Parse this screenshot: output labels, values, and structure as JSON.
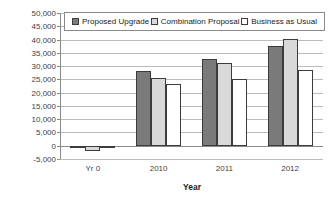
{
  "chart_data": {
    "type": "bar",
    "title": "",
    "xlabel": "Year",
    "ylabel": "Net Cash Flow ($1,000s)",
    "categories": [
      "Yr 0",
      "2010",
      "2011",
      "2012"
    ],
    "series": [
      {
        "name": "Proposed Upgrade",
        "color": "#7a7a7a",
        "values": [
          -1000,
          28000,
          32700,
          37500
        ]
      },
      {
        "name": "Combination Proposal",
        "color": "#d9d9d9",
        "values": [
          -2000,
          25700,
          31300,
          40200
        ]
      },
      {
        "name": "Business as Usual",
        "color": "#ffffff",
        "values": [
          -500,
          23300,
          25000,
          28600
        ]
      }
    ],
    "ylim": [
      -5000,
      50000
    ],
    "ytick_step": 5000,
    "grid": true,
    "legend_position": "top-inside",
    "colors": {
      "gridline": "#bcbcbc",
      "axis": "#8a8a8a",
      "tick_text": "#3f3f3f",
      "bar_border": "#3c3c3c",
      "background": "#ffffff"
    }
  }
}
